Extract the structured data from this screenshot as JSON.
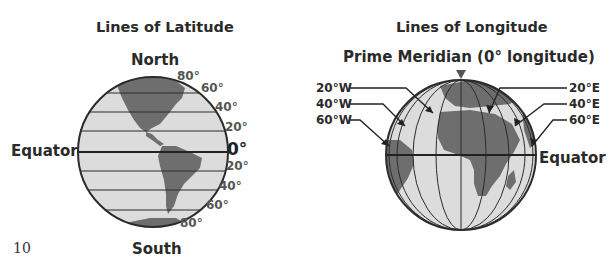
{
  "latitude": {
    "title": "Lines of Latitude",
    "north_label": "North",
    "south_label": "South",
    "equator_label": "Equator",
    "north_degrees": [
      "80°",
      "60°",
      "40°",
      "20°"
    ],
    "zero_label": "0°",
    "south_degrees": [
      "20°",
      "40°",
      "60°",
      "80°"
    ]
  },
  "longitude": {
    "title": "Lines of Longitude",
    "prime_meridian_label": "Prime Meridian (0° longitude)",
    "west_labels": [
      "20°W",
      "40°W",
      "60°W"
    ],
    "east_labels": [
      "20°E",
      "40°E",
      "60°E"
    ],
    "equator_label": "Equator"
  },
  "page_number": "10",
  "colors": {
    "ocean": "#d9d9d9",
    "land": "#6e6e6e",
    "lines": "#2b2b2b"
  }
}
